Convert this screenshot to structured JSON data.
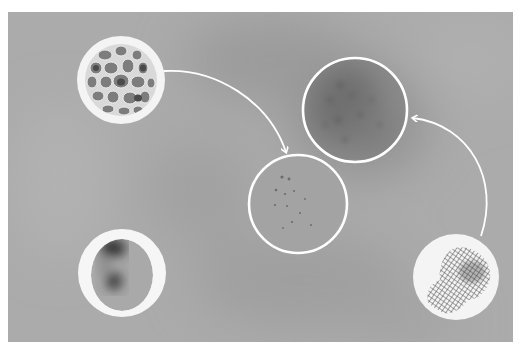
{
  "figure": {
    "type": "micrograph-schematic",
    "background_color": "#a8a8a8",
    "border_color": "#ffffff",
    "panel": {
      "x": 8,
      "y": 12,
      "width": 505,
      "height": 330
    },
    "insets": [
      {
        "id": "foam-inset",
        "description": "white disk with foam/porous cell texture",
        "cx": 121,
        "cy": 80,
        "r": 44
      },
      {
        "id": "blob-inset",
        "description": "white ring containing dark oval with two dark spots",
        "cx": 122,
        "cy": 273,
        "r": 44
      },
      {
        "id": "mesh-inset",
        "description": "white disk with cross-hatched mesh patch",
        "cx": 456,
        "cy": 277,
        "r": 43
      }
    ],
    "outline_circles": [
      {
        "id": "sparse-dots-circle",
        "description": "outlined region with sparse dark speckles",
        "cx": 298,
        "cy": 204,
        "r": 49
      },
      {
        "id": "dense-region-circle",
        "description": "outlined darker dense region",
        "cx": 355,
        "cy": 110,
        "r": 53
      }
    ],
    "arrows": [
      {
        "id": "arrow-foam-to-sparse",
        "from": "foam-inset",
        "to": "sparse-dots-circle"
      },
      {
        "id": "arrow-mesh-to-dense",
        "from": "mesh-inset",
        "to": "dense-region-circle"
      }
    ],
    "colors": {
      "line": "#ffffff",
      "dark_spot": "#2a2a2a",
      "foam_cell": "#7a7a7a",
      "mesh": "#555555"
    }
  }
}
